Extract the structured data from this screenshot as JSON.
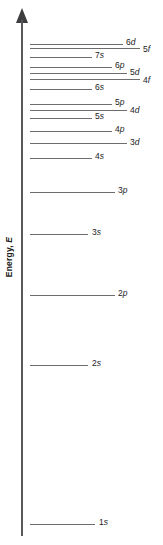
{
  "figure": {
    "type": "energy-level-diagram",
    "axis": {
      "title_text": "Energy, E",
      "title_prefix": "Energy, ",
      "title_symbol": "E",
      "direction": "increasing upward",
      "arrow": "up-arrow"
    },
    "line_color": "#6d6d70",
    "axis_color": "#58585a",
    "text_color": "#1b1b1b",
    "background": "#ffffff"
  },
  "chart_data": {
    "type": "scatter",
    "title": "",
    "xlabel": "",
    "ylabel": "Energy, E",
    "grid": false,
    "legend": false,
    "note": "Relative atomic orbital energies; each horizontal segment is one subshell level. y values are vertical pixel positions from top of the 545px image (smaller = higher energy).",
    "categories": [
      "1s",
      "2s",
      "2p",
      "3s",
      "3p",
      "4s",
      "3d",
      "4p",
      "5s",
      "4d",
      "5p",
      "6s",
      "4f",
      "5d",
      "6p",
      "7s",
      "5f",
      "6d"
    ],
    "levels": [
      {
        "label": "6d",
        "label_italic": "d",
        "y": 44,
        "x_start": 30,
        "x_end": 123,
        "label_x": 126,
        "label_y": 38
      },
      {
        "label": "5f",
        "label_italic": "f",
        "y": 48,
        "x_start": 30,
        "x_end": 140,
        "label_x": 143,
        "label_y": 45
      },
      {
        "label": "7s",
        "label_italic": "s",
        "y": 57,
        "x_start": 30,
        "x_end": 92,
        "label_x": 95,
        "label_y": 51
      },
      {
        "label": "6p",
        "label_italic": "p",
        "y": 67,
        "x_start": 30,
        "x_end": 112,
        "label_x": 115,
        "label_y": 61
      },
      {
        "label": "5d",
        "label_italic": "d",
        "y": 73,
        "x_start": 30,
        "x_end": 127,
        "label_x": 130,
        "label_y": 68
      },
      {
        "label": "4f",
        "label_italic": "f",
        "y": 79,
        "x_start": 30,
        "x_end": 140,
        "label_x": 143,
        "label_y": 76
      },
      {
        "label": "6s",
        "label_italic": "s",
        "y": 89,
        "x_start": 30,
        "x_end": 92,
        "label_x": 95,
        "label_y": 83
      },
      {
        "label": "5p",
        "label_italic": "p",
        "y": 104,
        "x_start": 30,
        "x_end": 112,
        "label_x": 115,
        "label_y": 98
      },
      {
        "label": "4d",
        "label_italic": "d",
        "y": 110,
        "x_start": 30,
        "x_end": 127,
        "label_x": 130,
        "label_y": 106
      },
      {
        "label": "5s",
        "label_italic": "s",
        "y": 118,
        "x_start": 30,
        "x_end": 92,
        "label_x": 95,
        "label_y": 112
      },
      {
        "label": "4p",
        "label_italic": "p",
        "y": 131,
        "x_start": 30,
        "x_end": 112,
        "label_x": 115,
        "label_y": 125
      },
      {
        "label": "3d",
        "label_italic": "d",
        "y": 143,
        "x_start": 30,
        "x_end": 127,
        "label_x": 130,
        "label_y": 138
      },
      {
        "label": "4s",
        "label_italic": "s",
        "y": 158,
        "x_start": 30,
        "x_end": 92,
        "label_x": 95,
        "label_y": 152
      },
      {
        "label": "3p",
        "label_italic": "p",
        "y": 192,
        "x_start": 30,
        "x_end": 115,
        "label_x": 118,
        "label_y": 186
      },
      {
        "label": "3s",
        "label_italic": "s",
        "y": 234,
        "x_start": 30,
        "x_end": 88,
        "label_x": 92,
        "label_y": 228
      },
      {
        "label": "2p",
        "label_italic": "p",
        "y": 295,
        "x_start": 30,
        "x_end": 115,
        "label_x": 118,
        "label_y": 289
      },
      {
        "label": "2s",
        "label_italic": "s",
        "y": 365,
        "x_start": 30,
        "x_end": 88,
        "label_x": 92,
        "label_y": 359
      },
      {
        "label": "1s",
        "label_italic": "s",
        "y": 524,
        "x_start": 30,
        "x_end": 95,
        "label_x": 99,
        "label_y": 518
      }
    ]
  }
}
